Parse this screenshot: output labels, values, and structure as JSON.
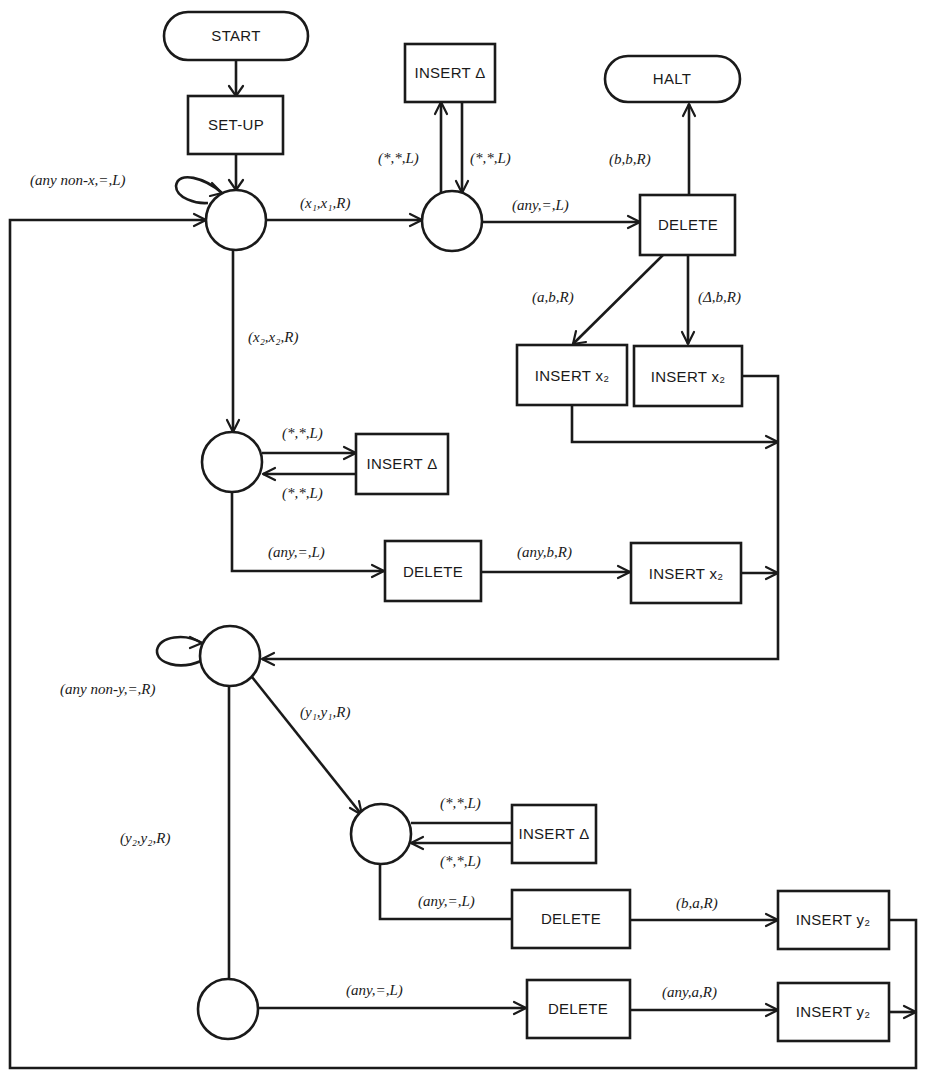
{
  "diagram": {
    "type": "flowchart",
    "terminals": {
      "start": "START",
      "halt": "HALT"
    },
    "boxes": {
      "setup": "SET-UP",
      "insert_delta_top": "INSERT Δ",
      "delete_top": "DELETE",
      "insert_x2_a": "INSERT x₂",
      "insert_x2_b": "INSERT x₂",
      "insert_delta_mid": "INSERT Δ",
      "delete_mid": "DELETE",
      "insert_x2_c": "INSERT x₂",
      "insert_delta_low": "INSERT Δ",
      "delete_low": "DELETE",
      "insert_y2_a": "INSERT y₂",
      "delete_bottom": "DELETE",
      "insert_y2_b": "INSERT y₂"
    },
    "edge_labels": {
      "loop_state1": "(any non-x,=,L)",
      "s1_to_s2": "(x₁,x₁,R)",
      "s2_to_insdelta": "(*,*,L)",
      "insdelta_to_s2": "(*,*,L)",
      "s2_to_delete": "(any,=,L)",
      "delete_to_halt": "(b,b,R)",
      "delete_to_insx2a": "(a,b,R)",
      "delete_to_insx2b": "(Δ,b,R)",
      "s1_to_s3": "(x₂,x₂,R)",
      "s3_to_insdelta": "(*,*,L)",
      "insdelta_to_s3": "(*,*,L)",
      "s3_to_delete": "(any,=,L)",
      "delete_to_insx2c": "(any,b,R)",
      "loop_state4": "(any non-y,=,R)",
      "s4_to_s5": "(y₁,y₁,R)",
      "s5_to_insdelta": "(*,*,L)",
      "insdelta_to_s5": "(*,*,L)",
      "s5_to_delete": "(any,=,L)",
      "delete_to_insy2a": "(b,a,R)",
      "s4_to_s6": "(y₂,y₂,R)",
      "s6_to_delete": "(any,=,L)",
      "delete_to_insy2b": "(any,a,R)"
    }
  }
}
